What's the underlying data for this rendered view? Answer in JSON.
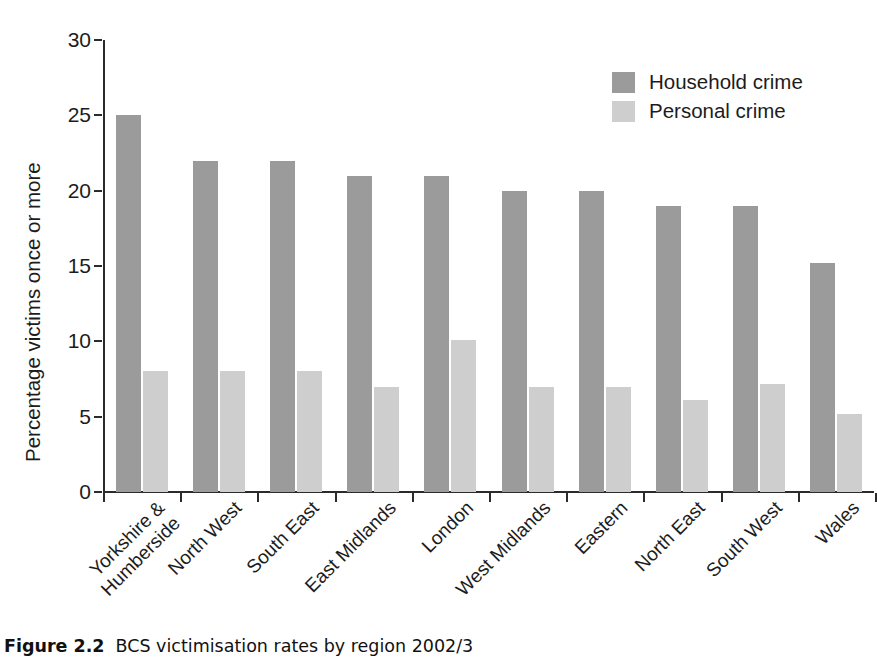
{
  "figure": {
    "caption_label": "Figure 2.2",
    "caption_text": "BCS victimisation rates by region 2002/3"
  },
  "legend": {
    "position": "top-right",
    "items": [
      {
        "label": "Household crime",
        "color": "#9b9b9b",
        "swatch": "household-swatch"
      },
      {
        "label": "Personal crime",
        "color": "#cecece",
        "swatch": "personal-swatch"
      }
    ]
  },
  "axes": {
    "y_title": "Percentage victims once or more",
    "y_ticks": [
      "0",
      "5",
      "10",
      "15",
      "20",
      "25",
      "30"
    ],
    "x_title": ""
  },
  "chart_data": {
    "type": "bar",
    "title": "BCS victimisation rates by region 2002/3",
    "xlabel": "",
    "ylabel": "Percentage victims once or more",
    "ylim": [
      0,
      30
    ],
    "ytick_step": 5,
    "grid": false,
    "legend_position": "top-right",
    "orientation": "vertical",
    "grouping": "grouped",
    "categories": [
      "Yorkshire & Humberside",
      "North West",
      "South East",
      "East Midlands",
      "London",
      "West Midlands",
      "Eastern",
      "North East",
      "South West",
      "Wales"
    ],
    "category_lines": [
      [
        "Yorkshire &",
        "Humberside"
      ],
      [
        "North West",
        ""
      ],
      [
        "South East",
        ""
      ],
      [
        "East Midlands",
        ""
      ],
      [
        "London",
        ""
      ],
      [
        "West Midlands",
        ""
      ],
      [
        "Eastern",
        ""
      ],
      [
        "North East",
        ""
      ],
      [
        "South West",
        ""
      ],
      [
        "Wales",
        ""
      ]
    ],
    "series": [
      {
        "name": "Household crime",
        "color": "#9b9b9b",
        "values": [
          25,
          22,
          22,
          21,
          21,
          20,
          20,
          19,
          19,
          15.2
        ]
      },
      {
        "name": "Personal crime",
        "color": "#cecece",
        "values": [
          8,
          8,
          8,
          7,
          10.1,
          7,
          7,
          6.1,
          7.2,
          5.2
        ]
      }
    ]
  }
}
